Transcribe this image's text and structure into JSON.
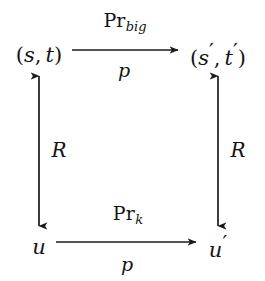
{
  "diagram": {
    "kind": "commutative-square",
    "background_color": "#ffffff",
    "ink_color": "#1a1a1a",
    "nodes": [
      {
        "id": "top-left",
        "text": "(s, t)",
        "base": "(s, t)",
        "x": 39,
        "y": 55
      },
      {
        "id": "top-right",
        "text": "(s', t')",
        "base": "(s",
        "x": 218,
        "y": 55
      },
      {
        "id": "bottom-left",
        "text": "u",
        "base": "u",
        "x": 39,
        "y": 247
      },
      {
        "id": "bottom-right",
        "text": "u'",
        "base": "u",
        "x": 218,
        "y": 247
      }
    ],
    "edges": [
      {
        "id": "top-edge",
        "from": "top-left",
        "to": "top-right",
        "direction": "right",
        "heads": 1,
        "label_above": "Pr",
        "label_above_sub": "big",
        "label_below": "p"
      },
      {
        "id": "bottom-edge",
        "from": "bottom-left",
        "to": "bottom-right",
        "direction": "right",
        "heads": 1,
        "label_above": "Pr",
        "label_above_sub": "k",
        "label_below": "p"
      },
      {
        "id": "left-edge",
        "from": "bottom-left",
        "to": "top-left",
        "direction": "both",
        "heads": 2,
        "label_side": "R"
      },
      {
        "id": "right-edge",
        "from": "bottom-right",
        "to": "top-right",
        "direction": "both",
        "heads": 2,
        "label_side": "R"
      }
    ],
    "symbols": {
      "prime": "′",
      "open_paren": "(",
      "close_paren": ")",
      "comma": ","
    }
  }
}
